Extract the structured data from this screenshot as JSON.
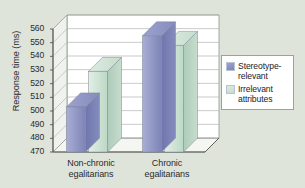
{
  "chart_data": {
    "type": "bar",
    "title": "",
    "subtitle": "",
    "xlabel": "",
    "ylabel": "Response time (ms)",
    "ylim": [
      470,
      560
    ],
    "ytick_labels": [
      "560",
      "550",
      "540",
      "530",
      "520",
      "510",
      "500",
      "490",
      "480",
      "470"
    ],
    "ytick_values": [
      560,
      550,
      540,
      530,
      520,
      510,
      500,
      490,
      480,
      470
    ],
    "grid": true,
    "three_d": true,
    "legend_position": "right",
    "categories": [
      "Non-chronic egalitarians",
      "Chronic egalitarians"
    ],
    "category_lines": [
      [
        "Non-chronic",
        "egalitarians"
      ],
      [
        "Chronic",
        "egalitarians"
      ]
    ],
    "series": [
      {
        "name": "Stereotype-relevant",
        "name_lines": [
          "Stereotype-",
          "relevant"
        ],
        "color": "#8a91c2",
        "values": [
          503,
          555
        ]
      },
      {
        "name": "Irrelevant attributes",
        "name_lines": [
          "Irrelevant",
          "attributes"
        ],
        "color": "#cbe2d4",
        "values": [
          529,
          548
        ]
      }
    ]
  },
  "colors": {
    "background": "#dfe4da",
    "plot_area": "#ffffff",
    "gridline": "#b3b3b3",
    "axis": "#555555",
    "series_blue": "#8a91c2",
    "series_green": "#cbe2d4",
    "legend_border": "#9aa39a",
    "text": "#2b2b2b"
  }
}
